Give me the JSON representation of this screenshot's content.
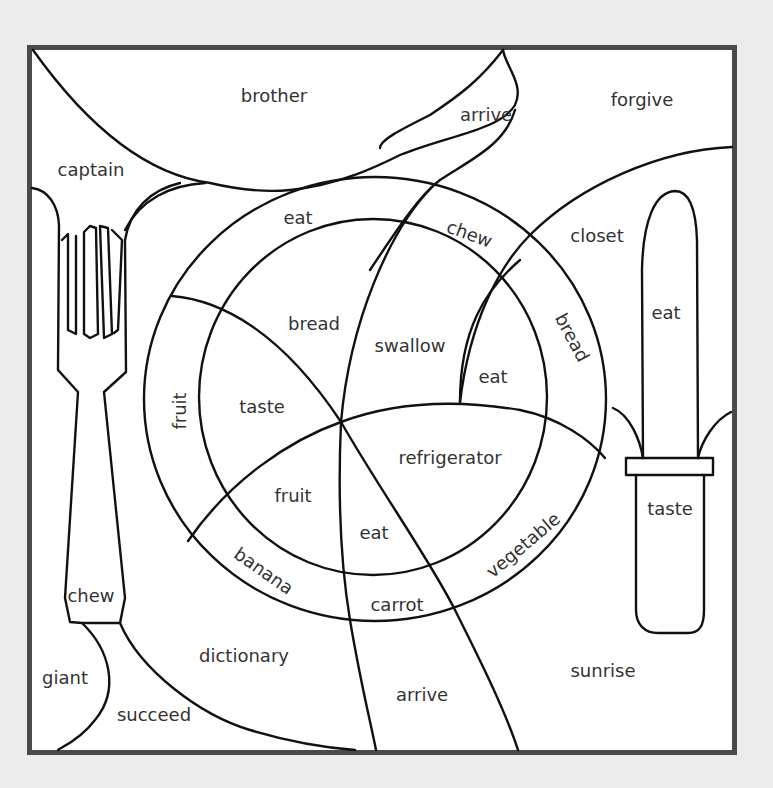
{
  "colors": {
    "background": "#ececec",
    "frame": "#4a4a4a",
    "line": "#111111",
    "text": "#333333",
    "paper": "#ffffff"
  },
  "regions": {
    "brother": "brother",
    "arrive_top": "arrive",
    "forgive": "forgive",
    "captain": "captain",
    "eat_rim_top": "eat",
    "chew_rim": "chew",
    "closet": "closet",
    "bread_inner": "bread",
    "swallow": "swallow",
    "bread_rim": "bread",
    "eat_inner_right": "eat",
    "eat_knife_blade": "eat",
    "fruit_rim": "fruit",
    "taste_inner": "taste",
    "refrigerator": "refrigerator",
    "fruit_inner": "fruit",
    "eat_inner_bottom": "eat",
    "vegetable_rim": "vegetable",
    "taste_knife_handle": "taste",
    "banana_rim": "banana",
    "carrot_rim": "carrot",
    "chew_fork_handle": "chew",
    "dictionary": "dictionary",
    "sunrise": "sunrise",
    "giant": "giant",
    "arrive_bottom": "arrive",
    "succeed": "succeed"
  }
}
